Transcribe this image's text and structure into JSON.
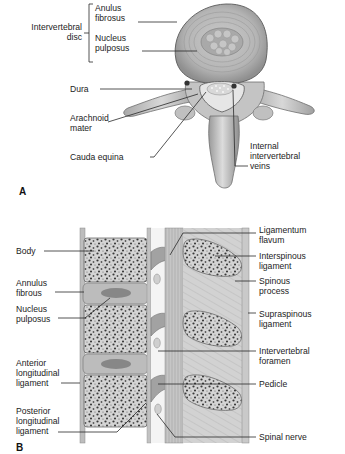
{
  "figure": {
    "panels": [
      {
        "id": "A",
        "letter": "A",
        "view": "axial section of lumbar vertebra",
        "labels": {
          "group_intervertebral_disc": "Intervertebral disc",
          "group_line1": "Intervertebral",
          "group_line2": "disc",
          "anulus_1": "Anulus",
          "anulus_2": "fibrosus",
          "nucleus_1": "Nucleus",
          "nucleus_2": "pulposus",
          "dura": "Dura",
          "arachnoid_1": "Arachnoid",
          "arachnoid_2": "mater",
          "cauda": "Cauda equina",
          "veins_1": "Internal",
          "veins_2": "intervertebral",
          "veins_3": "veins"
        }
      },
      {
        "id": "B",
        "letter": "B",
        "view": "sagittal section of lumbar spine",
        "labels": {
          "body": "Body",
          "annulus_1": "Annulus",
          "annulus_2": "fibrous",
          "nucleus_1": "Nucleus",
          "nucleus_2": "pulposus",
          "anterior_1": "Anterior",
          "anterior_2": "longitudinal",
          "anterior_3": "ligament",
          "posterior_1": "Posterior",
          "posterior_2": "longitudinal",
          "posterior_3": "ligament",
          "flavum_1": "Ligamentum",
          "flavum_2": "flavum",
          "interspinous_1": "Interspinous",
          "interspinous_2": "ligament",
          "spinous_1": "Spinous",
          "spinous_2": "process",
          "supraspinous_1": "Supraspinous",
          "supraspinous_2": "ligament",
          "foramen_1": "Intervertebral",
          "foramen_2": "foramen",
          "pedicle": "Pedicle",
          "nerve": "Spinal nerve"
        }
      }
    ],
    "colors": {
      "background": "#ffffff",
      "bone": "#cfcfcf",
      "bone_dark": "#8a8a8a",
      "disc": "#b8b8b8",
      "leader": "#2a2a2a",
      "text": "#1c1c1c"
    }
  }
}
